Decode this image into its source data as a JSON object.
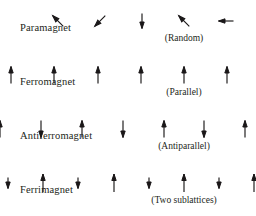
{
  "figure": {
    "background_color": "#ffffff",
    "ink_color": "#231f20"
  },
  "rows": [
    {
      "key": "paramagnet",
      "label": "Paramagnet",
      "caption": "(Random)",
      "arrow_style": "random-directions",
      "spin_count": 7,
      "spins": [
        {
          "name": "spin-up-left",
          "angle_deg": 315,
          "length": 15
        },
        {
          "name": "spin-down-left",
          "angle_deg": 225,
          "length": 15
        },
        {
          "name": "spin-down",
          "angle_deg": 180,
          "length": 15
        },
        {
          "name": "spin-up-left-2",
          "angle_deg": 315,
          "length": 15
        },
        {
          "name": "spin-left",
          "angle_deg": 270,
          "length": 15
        },
        {
          "name": "spin-right",
          "angle_deg": 90,
          "length": 15
        },
        {
          "name": "spin-down-right",
          "angle_deg": 135,
          "length": 15
        }
      ]
    },
    {
      "key": "ferromagnet",
      "label": "Ferromagnet",
      "caption": "(Parallel)",
      "arrow_style": "all-parallel-up",
      "spin_count": 9,
      "spins": [
        {
          "name": "spin-up",
          "angle_deg": 0,
          "length": 17
        },
        {
          "name": "spin-up",
          "angle_deg": 0,
          "length": 17
        },
        {
          "name": "spin-up",
          "angle_deg": 0,
          "length": 17
        },
        {
          "name": "spin-up",
          "angle_deg": 0,
          "length": 17
        },
        {
          "name": "spin-up",
          "angle_deg": 0,
          "length": 17
        },
        {
          "name": "spin-up",
          "angle_deg": 0,
          "length": 17
        },
        {
          "name": "spin-up",
          "angle_deg": 0,
          "length": 17
        },
        {
          "name": "spin-up",
          "angle_deg": 0,
          "length": 17
        },
        {
          "name": "spin-up",
          "angle_deg": 0,
          "length": 17
        }
      ]
    },
    {
      "key": "antiferromagnet",
      "label": "Antiferromagnet",
      "caption": "(Antiparallel)",
      "arrow_style": "alternating-equal",
      "spin_count": 10,
      "spins": [
        {
          "name": "spin-up",
          "angle_deg": 0,
          "length": 17
        },
        {
          "name": "spin-down",
          "angle_deg": 180,
          "length": 17
        },
        {
          "name": "spin-up",
          "angle_deg": 0,
          "length": 17
        },
        {
          "name": "spin-down",
          "angle_deg": 180,
          "length": 17
        },
        {
          "name": "spin-up",
          "angle_deg": 0,
          "length": 17
        },
        {
          "name": "spin-down",
          "angle_deg": 180,
          "length": 17
        },
        {
          "name": "spin-up",
          "angle_deg": 0,
          "length": 17
        },
        {
          "name": "spin-down",
          "angle_deg": 180,
          "length": 17
        },
        {
          "name": "spin-up",
          "angle_deg": 0,
          "length": 17
        },
        {
          "name": "spin-down",
          "angle_deg": 180,
          "length": 17
        }
      ]
    },
    {
      "key": "ferrimagnet",
      "label": "Ferrimagnet",
      "caption": "(Two sublattices)",
      "arrow_style": "alternating-unequal",
      "spin_count": 13,
      "spins": [
        {
          "name": "spin-up",
          "angle_deg": 0,
          "length": 18
        },
        {
          "name": "spin-down-short",
          "angle_deg": 180,
          "length": 11
        },
        {
          "name": "spin-up",
          "angle_deg": 0,
          "length": 18
        },
        {
          "name": "spin-down-short",
          "angle_deg": 180,
          "length": 11
        },
        {
          "name": "spin-up",
          "angle_deg": 0,
          "length": 18
        },
        {
          "name": "spin-down-short",
          "angle_deg": 180,
          "length": 11
        },
        {
          "name": "spin-up",
          "angle_deg": 0,
          "length": 18
        },
        {
          "name": "spin-down-short",
          "angle_deg": 180,
          "length": 11
        },
        {
          "name": "spin-up",
          "angle_deg": 0,
          "length": 18
        },
        {
          "name": "spin-down-short",
          "angle_deg": 180,
          "length": 11
        },
        {
          "name": "spin-up",
          "angle_deg": 0,
          "length": 18
        },
        {
          "name": "spin-down-short",
          "angle_deg": 180,
          "length": 11
        },
        {
          "name": "spin-up",
          "angle_deg": 0,
          "length": 18
        }
      ]
    }
  ]
}
